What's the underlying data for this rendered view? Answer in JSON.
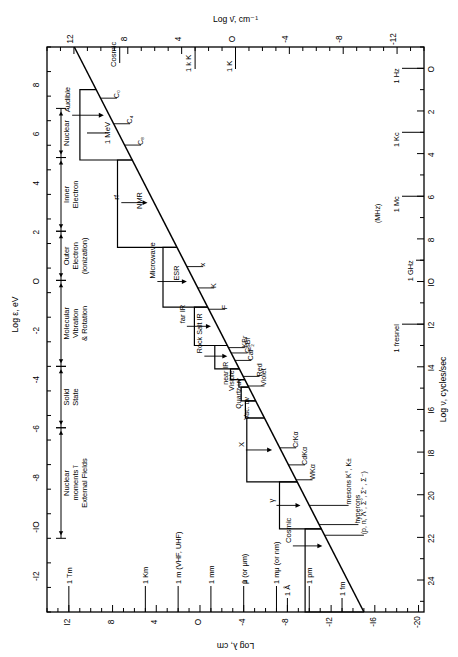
{
  "figure": {
    "kind": "scientific-figure",
    "orientation": "rotated-90-clockwise"
  },
  "axes": {
    "top": {
      "label": "Log ν̄, cm⁻¹",
      "ticks": [
        "-12",
        "-8",
        "-4",
        "O",
        "4",
        "8",
        "12"
      ],
      "tick_values": [
        -12,
        -8,
        -4,
        0,
        4,
        8,
        12
      ],
      "range": [
        -14,
        14
      ],
      "annotations": [
        {
          "label": "1 K",
          "value": 0
        },
        {
          "label": "1 k K",
          "value": 3
        },
        {
          "label": "Cosmic",
          "value": 8.6
        }
      ]
    },
    "left": {
      "label": "Log ε, eV",
      "ticks": [
        "8",
        "6",
        "4",
        "2",
        "O",
        "-2",
        "-4",
        "-6",
        "-8",
        "-IO",
        "-I2"
      ],
      "tick_values": [
        8,
        6,
        4,
        2,
        0,
        -2,
        -4,
        -6,
        -8,
        -10,
        -12
      ],
      "range": [
        9.5,
        -13.5
      ],
      "annotations": [
        {
          "label": "1 MeV",
          "value": 6
        }
      ],
      "bands": [
        {
          "name": "Nuclear",
          "from": 7.0,
          "to": 5.0,
          "lines": [
            "Nuclear"
          ]
        },
        {
          "name": "Inner Electron",
          "from": 5.0,
          "to": 2.0,
          "lines": [
            "Inner",
            "Electron"
          ]
        },
        {
          "name": "Outer Electron (ionization)",
          "from": 2.0,
          "to": 0.0,
          "lines": [
            "Outer",
            "Electron",
            "(ionization)"
          ]
        },
        {
          "name": "Molecular Vibration & Rotation",
          "from": 0.0,
          "to": -3.5,
          "lines": [
            "Molecular",
            "Vibration",
            "& Rotation"
          ]
        },
        {
          "name": "Solid State",
          "from": -3.5,
          "to": -6.0,
          "lines": [
            "Solid",
            "State"
          ]
        },
        {
          "name": "Nuclear moments in External Fields",
          "from": -6.0,
          "to": -10.5,
          "lines": [
            "Nuclear",
            "moments ĩ",
            "External Fields"
          ]
        }
      ]
    },
    "right": {
      "label": "Log ν, cycles/sec",
      "ticks": [
        "O",
        "2",
        "4",
        "6",
        "8",
        "IO",
        "I2",
        "I4",
        "I6",
        "I8",
        "20",
        "22",
        "24"
      ],
      "tick_values": [
        0,
        2,
        4,
        6,
        8,
        10,
        12,
        14,
        16,
        18,
        20,
        22,
        24
      ],
      "range": [
        -1,
        25.5
      ],
      "annotations": [
        {
          "label": "1 Hz",
          "value": 0
        },
        {
          "label": "1 Kc",
          "value": 3
        },
        {
          "label": "1 Mc",
          "value": 6
        },
        {
          "label": "(MHz)",
          "value": 6.8
        },
        {
          "label": "1 GHz",
          "value": 9
        },
        {
          "label": "1 fresnel",
          "value": 12
        }
      ]
    },
    "bottom": {
      "label": "Log λ, cm",
      "ticks": [
        "I2",
        "8",
        "4",
        "O",
        "-4",
        "-8",
        "-I2",
        "-I6",
        "-20"
      ],
      "tick_values": [
        12,
        8,
        4,
        0,
        -4,
        -8,
        -12,
        -16,
        -20
      ],
      "range": [
        14,
        -20.5
      ],
      "annotations": [
        {
          "label": "1 Tm",
          "value": 12
        },
        {
          "label": "1 Km",
          "value": 5
        },
        {
          "label": "1 m (VHF, UHF)",
          "value": 2
        },
        {
          "label": "1 mm",
          "value": -1
        },
        {
          "label": "μ  (or μm)",
          "value": -4,
          "prefix": "1"
        },
        {
          "label": "1 mμ (or nm)",
          "value": -7
        },
        {
          "label": "1 Å",
          "value": -8
        },
        {
          "label": "1 pm",
          "value": -10
        },
        {
          "label": "1 fm",
          "value": -13
        }
      ]
    }
  },
  "chart_data": {
    "type": "line",
    "xlabel": "Log ν, cycles/sec",
    "ylabel": "Log λ, cm",
    "xlim": [
      -1,
      25.5
    ],
    "ylim": [
      14,
      -20.5
    ],
    "grid": false,
    "legend": "none",
    "diagonal_line": {
      "name": "lambda = c / nu",
      "x": [
        -1,
        25.5
      ],
      "y": [
        11.5,
        -15.0
      ]
    },
    "staircase_steps": [
      {
        "name": "Audible",
        "nu_from": 1.0,
        "nu_to": 4.3,
        "height": 1.1
      },
      {
        "name": "NMR",
        "nu_from": 4.3,
        "nu_to": 8.4,
        "height": 1.0
      },
      {
        "name": "ESR",
        "nu_from": 8.4,
        "nu_to": 11.2,
        "height": 0.95
      },
      {
        "name": "far IR",
        "nu_from": 11.2,
        "nu_to": 13.0,
        "height": 0.9
      },
      {
        "name": "Rock Salt IR",
        "nu_from": 13.0,
        "nu_to": 14.1,
        "height": 0.85
      },
      {
        "name": "near IR",
        "nu_from": 14.1,
        "nu_to": 14.6,
        "height": 0.6
      },
      {
        "name": "Visible",
        "nu_from": 14.6,
        "nu_to": 14.95,
        "height": 0.4
      },
      {
        "name": "Quartz uv",
        "nu_from": 14.95,
        "nu_to": 15.6,
        "height": 0.5
      },
      {
        "name": "Vac. uv",
        "nu_from": 15.6,
        "nu_to": 16.4,
        "height": 0.7
      },
      {
        "name": "X",
        "nu_from": 16.4,
        "nu_to": 19.4,
        "height": 1.2
      },
      {
        "name": "γ",
        "nu_from": 19.4,
        "nu_to": 21.6,
        "height": 1.2
      },
      {
        "name": "Cosmic",
        "nu_from": 21.6,
        "nu_to": 25.5,
        "height": 1.1
      }
    ],
    "region_labels": [
      "Audible",
      "NMR",
      "rf",
      "ESR",
      "Microwave",
      "far IR",
      "Rock Salt IR",
      "near IR",
      "Visible",
      "Quartz uv",
      "Vac. uv",
      "Red",
      "Violet",
      "X",
      "γ",
      "Cosmic"
    ],
    "tick_markers": [
      {
        "label": "C₀",
        "nu": 1.4
      },
      {
        "label": "C₄",
        "nu": 2.6
      },
      {
        "label": "C₈",
        "nu": 3.6
      },
      {
        "label": "x",
        "nu": 9.3
      },
      {
        "label": "K",
        "nu": 10.3
      },
      {
        "label": "F",
        "nu": 11.3
      },
      {
        "label": "KBr",
        "nu": 13.1
      },
      {
        "label": "CsBr",
        "nu": 13.35
      },
      {
        "label": "CaF₂",
        "nu": 13.7
      },
      {
        "label": "Red",
        "nu": 14.45
      },
      {
        "label": "Violet",
        "nu": 14.9
      },
      {
        "label": "CrKα",
        "nu": 17.8
      },
      {
        "label": "CdKα",
        "nu": 18.6
      },
      {
        "label": "WKα",
        "nu": 19.3
      },
      {
        "label": "mesons K°, K±",
        "nu": 20.5
      },
      {
        "label": "hyperons",
        "nu": 21.4
      },
      {
        "label": "(p, n, Λ°, Σ°, Σ⁺, Σ⁻)",
        "nu": 21.9
      }
    ]
  }
}
